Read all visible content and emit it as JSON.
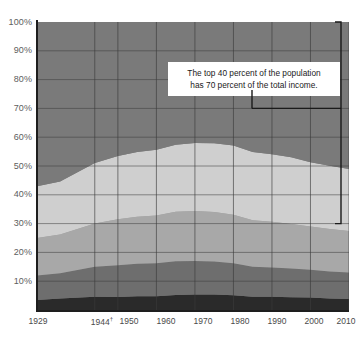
{
  "chart_data": {
    "type": "area",
    "title": "",
    "subtitle": "",
    "xlabel": "",
    "ylabel": "",
    "stacked": true,
    "stack_to_percent": true,
    "grid": true,
    "legend_position": "none",
    "ylim": [
      0,
      100
    ],
    "ytick_labels": [
      "100%",
      "90%",
      "80%",
      "70%",
      "60%",
      "50%",
      "40%",
      "30%",
      "20%",
      "10%"
    ],
    "ytick_values": [
      100,
      90,
      80,
      70,
      60,
      50,
      40,
      30,
      20,
      10
    ],
    "xtick_labels": [
      "1929",
      "1944",
      "1950",
      "1960",
      "1970",
      "1980",
      "1990",
      "2000",
      "2010"
    ],
    "xtick_values": [
      1929,
      1944,
      1950,
      1960,
      1970,
      1980,
      1990,
      2000,
      2010
    ],
    "xtick_footnote_marker": "†",
    "xtick_footnote_on": "1944",
    "xlim": [
      1929,
      2010
    ],
    "x": [
      1929,
      1935,
      1944,
      1950,
      1955,
      1960,
      1965,
      1970,
      1975,
      1980,
      1985,
      1990,
      1995,
      2000,
      2005,
      2010
    ],
    "series": [
      {
        "name": "Lowest quintile",
        "color": "#2a2a2a",
        "values": [
          3.5,
          4.0,
          4.6,
          4.5,
          4.8,
          4.8,
          5.2,
          5.4,
          5.4,
          5.1,
          4.6,
          4.6,
          4.4,
          4.3,
          4.0,
          3.8
        ]
      },
      {
        "name": "Second quintile",
        "color": "#6e6e6e",
        "values": [
          8.5,
          8.8,
          10.4,
          11.0,
          11.3,
          11.4,
          11.7,
          11.6,
          11.4,
          11.1,
          10.4,
          10.2,
          10.0,
          9.7,
          9.4,
          9.2
        ]
      },
      {
        "name": "Middle quintile",
        "color": "#a8a8a8",
        "values": [
          13.0,
          13.4,
          15.0,
          16.0,
          16.3,
          16.6,
          17.2,
          17.4,
          17.2,
          16.9,
          16.2,
          15.8,
          15.5,
          15.0,
          14.7,
          14.4
        ]
      },
      {
        "name": "Fourth quintile",
        "color": "#cfcfcf",
        "values": [
          18.0,
          18.4,
          21.0,
          22.0,
          22.5,
          22.8,
          23.3,
          23.6,
          23.9,
          24.0,
          23.7,
          23.5,
          23.1,
          22.3,
          22.0,
          21.6
        ]
      },
      {
        "name": "Highest quintile",
        "color": "#7a7a7a",
        "values": [
          57.0,
          55.4,
          49.0,
          46.5,
          45.1,
          44.4,
          42.6,
          42.0,
          42.1,
          42.9,
          45.1,
          45.9,
          47.0,
          48.7,
          49.9,
          51.0
        ]
      }
    ],
    "annotation": {
      "line1": "The top 40 percent of the population",
      "line2": "has 70 percent of the total income.",
      "bracket_top_percent": 100,
      "bracket_bottom_percent": 30,
      "bracket_leader_percent": 70,
      "bracket_color": "#1a1a1a"
    },
    "plot_background": "#7a7a7a",
    "gridline_color": "#3c3c3c",
    "axis_color": "#1e1e1e"
  }
}
